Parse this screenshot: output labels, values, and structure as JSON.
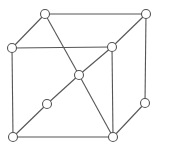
{
  "diagram": {
    "type": "cube-graph",
    "colors": {
      "stroke": "#555555",
      "node_fill": "#ffffff",
      "background": "#ffffff"
    },
    "node_radius": 4.5,
    "nodes": [
      {
        "id": "top-back-left",
        "x": 45,
        "y": 14
      },
      {
        "id": "top-back-right",
        "x": 146,
        "y": 14
      },
      {
        "id": "front-top-left",
        "x": 12,
        "y": 48
      },
      {
        "id": "front-top-right",
        "x": 112,
        "y": 47
      },
      {
        "id": "center",
        "x": 79,
        "y": 75
      },
      {
        "id": "mid-diagonal",
        "x": 47,
        "y": 104
      },
      {
        "id": "back-right-lower",
        "x": 145,
        "y": 103
      },
      {
        "id": "front-bottom-left",
        "x": 13,
        "y": 137
      },
      {
        "id": "front-bottom-right",
        "x": 113,
        "y": 137
      }
    ],
    "edges": [
      [
        "top-back-left",
        "top-back-right"
      ],
      [
        "top-back-left",
        "front-top-left"
      ],
      [
        "top-back-left",
        "center"
      ],
      [
        "front-top-left",
        "front-top-right"
      ],
      [
        "front-top-left",
        "front-bottom-left"
      ],
      [
        "top-back-right",
        "front-top-right"
      ],
      [
        "front-top-right",
        "center"
      ],
      [
        "center",
        "mid-diagonal"
      ],
      [
        "mid-diagonal",
        "front-bottom-left"
      ],
      [
        "top-back-right",
        "back-right-lower"
      ],
      [
        "front-top-right",
        "front-bottom-right"
      ],
      [
        "center",
        "front-bottom-right"
      ],
      [
        "front-bottom-left",
        "front-bottom-right"
      ],
      [
        "back-right-lower",
        "front-bottom-right"
      ]
    ]
  }
}
